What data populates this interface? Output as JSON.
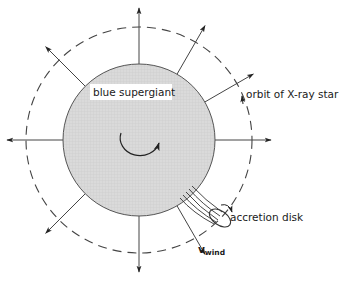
{
  "diagram": {
    "type": "astrophysics-schematic",
    "labels": {
      "star": "blue supergiant",
      "orbit": "orbit of X-ray star",
      "disk": "accretion disk",
      "wind_v": "v",
      "wind_sub": "wind"
    },
    "colors": {
      "star_fill": "#d9d9d9",
      "star_hatch": "#c6c6c6",
      "line": "#333333",
      "label_bg": "#ffffff",
      "background": "#ffffff"
    },
    "geometry": {
      "center": [
        139,
        140
      ],
      "star_radius": 76,
      "orbit_radius": 113,
      "arrow_outer_radius": 132
    },
    "wind_arrows_deg": [
      0,
      30,
      60,
      90,
      135,
      180,
      225,
      270,
      300
    ]
  }
}
